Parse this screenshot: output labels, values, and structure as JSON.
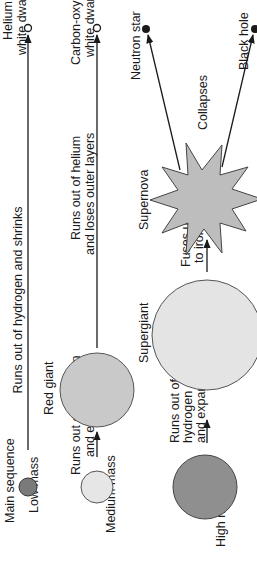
{
  "diagram": {
    "orientation": "rotated -90deg (text reads bottom-to-top)",
    "colors": {
      "low_mass_star": "#7a7a7a",
      "medium_mass_star": "#e6e6e6",
      "red_giant": "#c9c9c9",
      "high_mass_star": "#8f8f8f",
      "supergiant": "#e4e4e4",
      "supernova": "#bdbdbd",
      "line": "#1a1a1a"
    },
    "rows": [
      {
        "id": "low",
        "label_top": "Main sequence",
        "label_bottom": "Low mass",
        "transition_1": "Runs out of hydrogen and shrinks",
        "end": {
          "line1": "Helium",
          "line2": "white dwarf"
        }
      },
      {
        "id": "medium",
        "label_bottom": "Medium mass",
        "transition_1": {
          "line1": "Runs out of hydrogen",
          "line2": "and expands"
        },
        "stage_2": "Red giant",
        "transition_2": {
          "line1": "Runs out of helium",
          "line2": "and loses outer layers"
        },
        "end": {
          "line1": "Carbon-oxygen",
          "line2": "white dwarf"
        }
      },
      {
        "id": "high",
        "label_bottom": "High mass",
        "transition_1": {
          "line1": "Runs out of",
          "line2": "hydrogen",
          "line3": "and expands"
        },
        "stage_2": "Supergiant",
        "transition_2": {
          "line1": "Fuses up",
          "line2": "to iron"
        },
        "stage_3": "Supernova",
        "transition_3": "Collapses",
        "end_a": "Neutron star",
        "end_b": "Black hole"
      }
    ]
  }
}
